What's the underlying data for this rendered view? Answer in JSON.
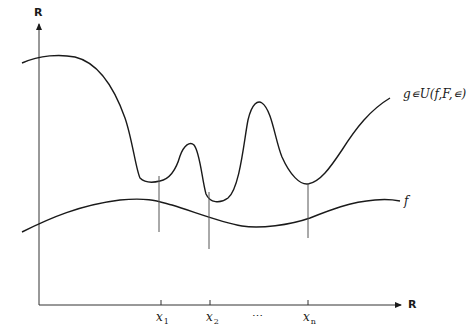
{
  "figure": {
    "y_axis_label": "R",
    "x_axis_label": "R",
    "curve_g_label": "g∊U(f,F,∊)",
    "curve_f_label": "f",
    "x_ticks": [
      {
        "base": "x",
        "sub": "1"
      },
      {
        "base": "x",
        "sub": "2"
      },
      {
        "ellipsis": "⋯"
      },
      {
        "base": "x",
        "sub": "n"
      }
    ],
    "colors": {
      "stroke": "#1a1a1a",
      "guide": "#555555",
      "background": "#ffffff"
    }
  }
}
